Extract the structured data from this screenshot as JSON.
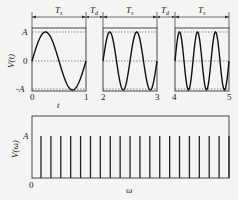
{
  "top_plot": {
    "ylabel": "V(t)",
    "xlabel": "t",
    "y_ticks": [
      "A",
      "0",
      "-A"
    ],
    "x_ticks": [
      "0",
      "1",
      "2",
      "3",
      "4",
      "5"
    ],
    "interval_labels": {
      "Ts_main": "T",
      "Ts_sub": "s",
      "Td_main": "T",
      "Td_sub": "d"
    },
    "segments": [
      {
        "t_start": 0,
        "t_end": 1,
        "cycles": 1
      },
      {
        "t_start": 2,
        "t_end": 3,
        "cycles": 2
      },
      {
        "t_start": 4,
        "t_end": 5,
        "cycles": 3
      }
    ]
  },
  "bottom_plot": {
    "ylabel": "V(ω)",
    "xlabel": "ω",
    "y_tick": "A",
    "x_tick": "0",
    "spike_count": 20,
    "spike_amplitude": "A"
  },
  "chart_data": [
    {
      "type": "line",
      "title": "",
      "xlabel": "t",
      "ylabel": "V(t)",
      "x_ticks": [
        0,
        1,
        2,
        3,
        4,
        5
      ],
      "y_ticks": [
        "-A",
        "0",
        "A"
      ],
      "series": [
        {
          "name": "segment 1 (Ts)",
          "x_range": [
            0,
            1
          ],
          "function": "A·sin(2π·1·t)"
        },
        {
          "name": "segment 2 (Ts)",
          "x_range": [
            2,
            3
          ],
          "function": "A·sin(2π·2·t)"
        },
        {
          "name": "segment 3 (Ts)",
          "x_range": [
            4,
            5
          ],
          "function": "A·sin(2π·3·t)"
        }
      ],
      "annotations": [
        "Ts",
        "Td",
        "Ts",
        "Td",
        "Ts"
      ]
    },
    {
      "type": "bar",
      "title": "",
      "xlabel": "ω",
      "ylabel": "V(ω)",
      "categories": [
        1,
        2,
        3,
        4,
        5,
        6,
        7,
        8,
        9,
        10,
        11,
        12,
        13,
        14,
        15,
        16,
        17,
        18,
        19,
        20
      ],
      "values": [
        1,
        1,
        1,
        1,
        1,
        1,
        1,
        1,
        1,
        1,
        1,
        1,
        1,
        1,
        1,
        1,
        1,
        1,
        1,
        1
      ],
      "value_label": "A (all spikes equal amplitude)"
    }
  ]
}
